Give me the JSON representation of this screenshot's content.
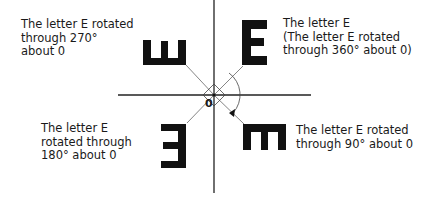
{
  "diagram": {
    "origin_label": "0",
    "rotation_arrow": "clockwise",
    "items": [
      {
        "id": "rot-270",
        "rotation_degrees": 270,
        "lines": [
          "The letter E rotated",
          "through 270°",
          "about 0"
        ]
      },
      {
        "id": "rot-360",
        "rotation_degrees": 360,
        "lines": [
          "The letter E",
          "(The letter E rotated",
          "through 360° about 0)"
        ]
      },
      {
        "id": "rot-180",
        "rotation_degrees": 180,
        "lines": [
          "The letter E",
          "rotated through",
          "180° about 0"
        ]
      },
      {
        "id": "rot-90",
        "rotation_degrees": 90,
        "lines": [
          "The letter E rotated",
          "through 90° about 0"
        ]
      }
    ],
    "colors": {
      "ink": "#111111",
      "line": "#555555"
    }
  }
}
